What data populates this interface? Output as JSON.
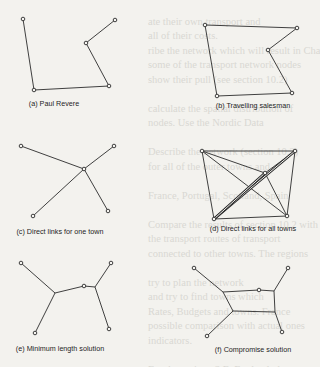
{
  "bleed_lines": [
    "",
    "ate their own transport and",
    "all of their costs.",
    "ribe the network which will result in Chapter",
    "some of the transport network nodes",
    "show their pull (see section 10.2)",
    "",
    "calculate the spatial distribution of",
    "nodes. Use the Nordic Data",
    "",
    "Describe the network (section 10.2)",
    "for all of the outer towns and",
    "",
    "France, Portugal, Scotland, Spain",
    "",
    "Compare the results of section 10.2 with",
    "the transport routes of transport",
    "connected to other towns. The regions",
    "",
    "try to plan the network",
    "and try to find towns which",
    "Rates, Budgets and towns. France",
    "possible comparison with actual ones",
    "indicators.",
    "",
    "For the regions S.E. England, the",
    "or make a map of the towns with Scotland",
    "sugar beet, and town railway, and",
    "",
    "Try to rank and compare networks",
    "with another town and region"
  ],
  "panels": [
    {
      "id": "a",
      "caption": "(a) Paul Revere",
      "caption_pos": [
        54,
        104
      ],
      "edges": [
        [
          23,
          19,
          34,
          90
        ],
        [
          34,
          90,
          109,
          86
        ],
        [
          109,
          86,
          86,
          43
        ],
        [
          86,
          43,
          115,
          20
        ]
      ],
      "towns": [
        [
          23,
          19
        ],
        [
          34,
          90
        ],
        [
          109,
          86
        ],
        [
          86,
          43
        ],
        [
          115,
          20
        ]
      ]
    },
    {
      "id": "b",
      "caption": "(b) Travelling salesman",
      "caption_pos": [
        253,
        106
      ],
      "edges": [
        [
          205,
          25,
          297,
          28
        ],
        [
          297,
          28,
          268,
          50
        ],
        [
          268,
          50,
          292,
          93
        ],
        [
          292,
          93,
          217,
          96
        ],
        [
          217,
          96,
          205,
          25
        ]
      ],
      "towns": [
        [
          205,
          25
        ],
        [
          297,
          28
        ],
        [
          268,
          50
        ],
        [
          292,
          93
        ],
        [
          217,
          96
        ]
      ]
    },
    {
      "id": "c",
      "caption": "(c) Direct links for one town",
      "caption_pos": [
        60,
        232
      ],
      "edges": [
        [
          21,
          146,
          84,
          169
        ],
        [
          114,
          146,
          84,
          169
        ],
        [
          33,
          216,
          84,
          169
        ],
        [
          108,
          211,
          84,
          169
        ]
      ],
      "towns": [
        [
          21,
          146
        ],
        [
          114,
          146
        ],
        [
          84,
          169
        ],
        [
          33,
          216
        ],
        [
          108,
          211
        ]
      ]
    },
    {
      "id": "d",
      "caption": "(d) Direct links for all towns",
      "caption_pos": [
        253,
        229
      ],
      "edges": [
        [
          202,
          151,
          295,
          151
        ],
        [
          202,
          151,
          214,
          219
        ],
        [
          202,
          151,
          287,
          216
        ],
        [
          202,
          151,
          265,
          173
        ],
        [
          295,
          151,
          287,
          216
        ],
        [
          295,
          151,
          265,
          173
        ],
        [
          214,
          219,
          287,
          216
        ],
        [
          287,
          216,
          265,
          173
        ]
      ],
      "double_edges": [
        [
          214,
          219,
          295,
          151
        ],
        [
          214,
          219,
          265,
          173
        ]
      ],
      "towns": [
        [
          202,
          151
        ],
        [
          295,
          151
        ],
        [
          265,
          173
        ],
        [
          214,
          219
        ],
        [
          287,
          216
        ]
      ]
    },
    {
      "id": "e",
      "caption": "(e) Minimum length solution",
      "caption_pos": [
        60,
        349
      ],
      "edges": [
        [
          21,
          263,
          55,
          293
        ],
        [
          35,
          333,
          55,
          293
        ],
        [
          55,
          293,
          84,
          286
        ],
        [
          84,
          286,
          95,
          287
        ],
        [
          95,
          287,
          111,
          263
        ],
        [
          95,
          287,
          109,
          329
        ]
      ],
      "towns": [
        [
          21,
          263
        ],
        [
          111,
          263
        ],
        [
          84,
          286
        ],
        [
          35,
          333
        ],
        [
          109,
          329
        ]
      ]
    },
    {
      "id": "f",
      "caption": "(f) Compromise solution",
      "caption_pos": [
        253,
        350
      ],
      "edges": [
        [
          194,
          268,
          223,
          292
        ],
        [
          223,
          292,
          259,
          290
        ],
        [
          259,
          290,
          274,
          291
        ],
        [
          274,
          291,
          288,
          268
        ],
        [
          223,
          292,
          233,
          311
        ],
        [
          207,
          336,
          233,
          311
        ],
        [
          233,
          311,
          275,
          312
        ],
        [
          274,
          291,
          275,
          312
        ],
        [
          275,
          312,
          282,
          332
        ]
      ],
      "towns": [
        [
          194,
          268
        ],
        [
          288,
          268
        ],
        [
          259,
          290
        ],
        [
          207,
          336
        ],
        [
          282,
          332
        ]
      ]
    }
  ]
}
